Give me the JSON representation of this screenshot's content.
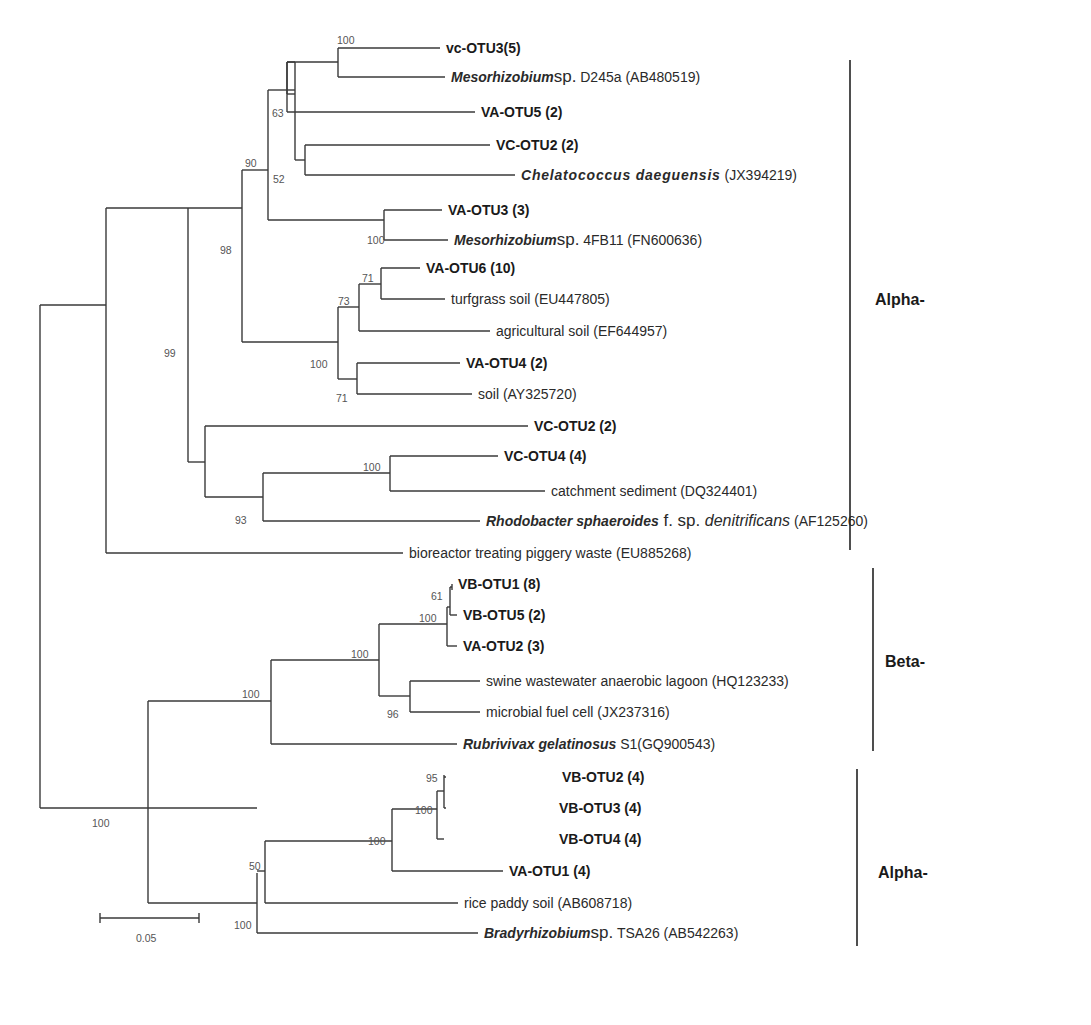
{
  "figure": {
    "type": "phylogenetic-tree",
    "scale_bar": {
      "label": "0.05",
      "x1": 100,
      "x2": 199,
      "y": 918
    }
  },
  "leaves": [
    {
      "id": "vc-otu3",
      "kind": "otu",
      "label": "vc-OTU3(5)",
      "x": 440,
      "y": 48,
      "big": true
    },
    {
      "id": "meso-d245a",
      "kind": "species",
      "name": "Mesorhizobium",
      "abbr": "sp.",
      "rest": " D245a (AB480519)",
      "x": 445,
      "y": 77
    },
    {
      "id": "va-otu5",
      "kind": "otu",
      "label": "VA-OTU5 (2)",
      "x": 475,
      "y": 112
    },
    {
      "id": "vc-otu2-a",
      "kind": "otu",
      "label": "VC-OTU2 (2)",
      "x": 490,
      "y": 145
    },
    {
      "id": "chelatococcus",
      "kind": "species",
      "name": "Chelatococcus daeguensis",
      "abbr": "",
      "rest": " (JX394219)",
      "x": 515,
      "y": 175,
      "wide": true
    },
    {
      "id": "va-otu3",
      "kind": "otu",
      "label": "VA-OTU3 (3)",
      "x": 442,
      "y": 210
    },
    {
      "id": "meso-4fb11",
      "kind": "species",
      "name": "Mesorhizobium",
      "abbr": "sp.",
      "rest": " 4FB11 (FN600636)",
      "x": 448,
      "y": 240
    },
    {
      "id": "va-otu6",
      "kind": "otu",
      "label": "VA-OTU6 (10)",
      "x": 420,
      "y": 268
    },
    {
      "id": "turfgrass",
      "kind": "env",
      "label": "turfgrass soil (EU447805)",
      "x": 445,
      "y": 299
    },
    {
      "id": "agricultural",
      "kind": "env",
      "label": "agricultural soil (EF644957)",
      "x": 490,
      "y": 331
    },
    {
      "id": "va-otu4",
      "kind": "otu",
      "label": "VA-OTU4 (2)",
      "x": 460,
      "y": 363
    },
    {
      "id": "soil",
      "kind": "env",
      "label": "soil (AY325720)",
      "x": 472,
      "y": 394
    },
    {
      "id": "vc-otu2-b",
      "kind": "otu",
      "label": "VC-OTU2 (2)",
      "x": 528,
      "y": 426
    },
    {
      "id": "vc-otu4",
      "kind": "otu",
      "label": "VC-OTU4 (4)",
      "x": 498,
      "y": 456
    },
    {
      "id": "catchment",
      "kind": "env",
      "label": "catchment sediment (DQ324401)",
      "x": 545,
      "y": 491
    },
    {
      "id": "rhodobacter",
      "kind": "species",
      "name": "Rhodobacter sphaeroides",
      "abbr": "f. sp.",
      "it": " denitrificans",
      "rest": " (AF125260)",
      "x": 480,
      "y": 521
    },
    {
      "id": "bioreactor",
      "kind": "env",
      "label": "bioreactor treating piggery waste (EU885268)",
      "x": 403,
      "y": 553
    },
    {
      "id": "vb-otu1",
      "kind": "otu",
      "label": "VB-OTU1 (8)",
      "x": 452,
      "y": 584
    },
    {
      "id": "vb-otu5",
      "kind": "otu",
      "label": "VB-OTU5 (2)",
      "x": 457,
      "y": 615
    },
    {
      "id": "va-otu2",
      "kind": "otu",
      "label": "VA-OTU2 (3)",
      "x": 457,
      "y": 646
    },
    {
      "id": "swine",
      "kind": "env",
      "label": "swine wastewater anaerobic lagoon (HQ123233)",
      "x": 480,
      "y": 681
    },
    {
      "id": "mfc",
      "kind": "env",
      "label": "microbial fuel cell (JX237316)",
      "x": 480,
      "y": 712
    },
    {
      "id": "rubrivivax",
      "kind": "species",
      "name": "Rubrivivax gelatinosus",
      "abbr": "",
      "rest": "  S1(GQ900543)",
      "x": 457,
      "y": 744
    },
    {
      "id": "vb-otu2",
      "kind": "otu",
      "label": "VB-OTU2 (4)",
      "x": 556,
      "y": 777
    },
    {
      "id": "vb-otu3",
      "kind": "otu",
      "label": "VB-OTU3 (4)",
      "x": 553,
      "y": 808
    },
    {
      "id": "vb-otu4",
      "kind": "otu",
      "label": "VB-OTU4 (4)",
      "x": 553,
      "y": 839
    },
    {
      "id": "va-otu1",
      "kind": "otu",
      "label": "VA-OTU1 (4)",
      "x": 503,
      "y": 871
    },
    {
      "id": "rice",
      "kind": "env",
      "label": "rice paddy soil (AB608718)",
      "x": 458,
      "y": 903
    },
    {
      "id": "bradyrhizobium",
      "kind": "species",
      "name": "Bradyrhizobium",
      "abbr": "sp.",
      "rest": " TSA26 (AB542263)",
      "x": 478,
      "y": 933
    }
  ],
  "edges": [
    [
      40,
      305,
      40,
      808
    ],
    [
      40,
      305,
      106,
      305
    ],
    [
      40,
      808,
      148,
      808
    ],
    [
      106,
      208,
      106,
      553
    ],
    [
      106,
      208,
      188,
      208
    ],
    [
      106,
      553,
      403,
      553
    ],
    [
      188,
      106,
      188,
      462
    ],
    [
      188,
      106,
      242,
      106
    ],
    [
      188,
      462,
      205,
      462
    ],
    [
      242,
      20,
      242,
      342
    ],
    [
      242,
      20,
      268,
      20
    ],
    [
      242,
      342,
      338,
      342
    ],
    [
      268,
      20,
      268,
      220
    ],
    [
      268,
      220,
      384,
      220
    ],
    [
      268,
      20,
      295,
      20
    ],
    [
      268,
      20,
      268,
      170
    ],
    [
      295,
      20,
      295,
      0
    ],
    [
      0,
      0,
      0,
      0
    ]
  ],
  "tree_edges": [
    [
      40,
      305,
      40,
      808
    ],
    [
      40,
      305,
      106,
      305
    ],
    [
      40,
      808,
      148,
      808
    ],
    [
      106,
      208,
      106,
      553
    ],
    [
      106,
      208,
      188,
      208
    ],
    [
      106,
      553,
      403,
      553
    ],
    [
      188,
      208,
      188,
      462
    ],
    [
      188,
      462,
      205,
      462
    ],
    [
      242,
      170,
      242,
      342
    ],
    [
      188,
      208,
      242,
      208
    ],
    [
      242,
      170,
      268,
      170
    ],
    [
      242,
      342,
      338,
      342
    ],
    [
      268,
      90,
      268,
      220
    ],
    [
      268,
      220,
      384,
      220
    ],
    [
      268,
      90,
      295,
      90
    ],
    [
      295,
      62,
      295,
      160
    ],
    [
      295,
      62,
      287,
      62
    ],
    [
      287,
      62,
      287,
      94
    ],
    [
      287,
      112,
      475,
      112
    ],
    [
      287,
      94,
      295,
      94
    ],
    [
      287,
      62,
      338,
      62
    ],
    [
      338,
      48,
      338,
      77
    ],
    [
      338,
      48,
      440,
      48
    ],
    [
      338,
      77,
      445,
      77
    ],
    [
      287,
      62,
      287,
      112
    ],
    [
      295,
      160,
      305,
      160
    ],
    [
      305,
      145,
      305,
      175
    ],
    [
      305,
      145,
      490,
      145
    ],
    [
      305,
      175,
      515,
      175
    ],
    [
      384,
      210,
      384,
      240
    ],
    [
      384,
      210,
      442,
      210
    ],
    [
      384,
      240,
      448,
      240
    ],
    [
      338,
      307,
      338,
      379
    ],
    [
      338,
      307,
      359,
      307
    ],
    [
      338,
      379,
      357,
      379
    ],
    [
      359,
      284,
      359,
      331
    ],
    [
      359,
      284,
      381,
      284
    ],
    [
      359,
      331,
      490,
      331
    ],
    [
      381,
      268,
      381,
      299
    ],
    [
      381,
      268,
      420,
      268
    ],
    [
      381,
      299,
      445,
      299
    ],
    [
      357,
      363,
      357,
      394
    ],
    [
      357,
      363,
      460,
      363
    ],
    [
      357,
      394,
      472,
      394
    ],
    [
      205,
      426,
      205,
      497
    ],
    [
      205,
      426,
      528,
      426
    ],
    [
      205,
      497,
      263,
      497
    ],
    [
      263,
      473,
      263,
      521
    ],
    [
      263,
      473,
      390,
      473
    ],
    [
      263,
      521,
      480,
      521
    ],
    [
      390,
      456,
      390,
      491
    ],
    [
      390,
      456,
      498,
      456
    ],
    [
      390,
      491,
      545,
      491
    ],
    [
      148,
      701,
      148,
      808
    ],
    [
      148,
      701,
      271,
      701
    ],
    [
      271,
      660,
      271,
      744
    ],
    [
      271,
      660,
      379,
      660
    ],
    [
      271,
      744,
      457,
      744
    ],
    [
      379,
      624,
      379,
      696
    ],
    [
      379,
      624,
      447,
      624
    ],
    [
      379,
      696,
      410,
      696
    ],
    [
      410,
      681,
      410,
      712
    ],
    [
      410,
      681,
      480,
      681
    ],
    [
      410,
      712,
      480,
      712
    ],
    [
      447,
      607,
      447,
      646
    ],
    [
      447,
      646,
      457,
      646
    ],
    [
      450,
      587,
      450,
      615
    ],
    [
      447,
      607,
      450,
      607
    ],
    [
      450,
      615,
      457,
      615
    ],
    [
      450,
      587,
      452,
      587
    ],
    [
      452,
      584,
      452,
      590
    ],
    [
      148,
      808,
      257,
      808
    ],
    [
      257,
      873,
      257,
      933
    ],
    [
      148,
      903,
      257,
      903
    ],
    [
      148,
      808,
      148,
      903
    ],
    [
      257,
      933,
      478,
      933
    ],
    [
      265,
      871,
      265,
      903
    ],
    [
      257,
      871,
      265,
      871
    ],
    [
      265,
      903,
      458,
      903
    ],
    [
      265,
      841,
      265,
      871
    ],
    [
      265,
      841,
      392,
      841
    ],
    [
      392,
      809,
      392,
      871
    ],
    [
      392,
      809,
      437,
      809
    ],
    [
      392,
      871,
      503,
      871
    ],
    [
      437,
      791,
      437,
      839
    ],
    [
      437,
      839,
      444,
      839
    ],
    [
      437,
      791,
      444,
      791
    ],
    [
      444,
      775,
      444,
      808
    ],
    [
      444,
      777,
      446,
      777
    ],
    [
      444,
      808,
      446,
      808
    ]
  ],
  "bootstrap": [
    {
      "v": "100",
      "x": 337,
      "y": 44
    },
    {
      "v": "63",
      "x": 272,
      "y": 117
    },
    {
      "v": "52",
      "x": 273,
      "y": 183
    },
    {
      "v": "90",
      "x": 245,
      "y": 167
    },
    {
      "v": "100",
      "x": 367,
      "y": 244
    },
    {
      "v": "98",
      "x": 220,
      "y": 254
    },
    {
      "v": "71",
      "x": 362,
      "y": 282
    },
    {
      "v": "73",
      "x": 338,
      "y": 305
    },
    {
      "v": "100",
      "x": 310,
      "y": 368
    },
    {
      "v": "71",
      "x": 336,
      "y": 402
    },
    {
      "v": "99",
      "x": 164,
      "y": 357
    },
    {
      "v": "100",
      "x": 363,
      "y": 471
    },
    {
      "v": "93",
      "x": 235,
      "y": 524
    },
    {
      "v": "61",
      "x": 431,
      "y": 600
    },
    {
      "v": "100",
      "x": 419,
      "y": 622
    },
    {
      "v": "100",
      "x": 351,
      "y": 658
    },
    {
      "v": "96",
      "x": 387,
      "y": 718
    },
    {
      "v": "100",
      "x": 242,
      "y": 698
    },
    {
      "v": "95",
      "x": 426,
      "y": 782
    },
    {
      "v": "100",
      "x": 415,
      "y": 814
    },
    {
      "v": "100",
      "x": 368,
      "y": 845
    },
    {
      "v": "50",
      "x": 249,
      "y": 870
    },
    {
      "v": "100",
      "x": 234,
      "y": 929
    },
    {
      "v": "100",
      "x": 92,
      "y": 827
    }
  ],
  "clades": [
    {
      "label": "Alpha-",
      "line": [
        850,
        60,
        850,
        550
      ],
      "tx": 875,
      "ty": 305
    },
    {
      "label": "Beta-",
      "line": [
        873,
        568,
        873,
        751
      ],
      "tx": 885,
      "ty": 667
    },
    {
      "label": "Alpha-",
      "line": [
        857,
        769,
        857,
        946
      ],
      "tx": 878,
      "ty": 878
    }
  ]
}
